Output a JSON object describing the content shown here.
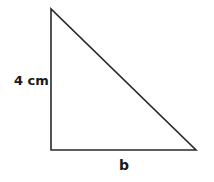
{
  "diagram": {
    "type": "right-triangle",
    "vertices": {
      "top": [
        51,
        9
      ],
      "bottom_left": [
        51,
        150
      ],
      "bottom_right": [
        196,
        150
      ]
    },
    "stroke_color": "#2a2a2a",
    "labels": {
      "height": "4 cm",
      "base": "b"
    }
  }
}
